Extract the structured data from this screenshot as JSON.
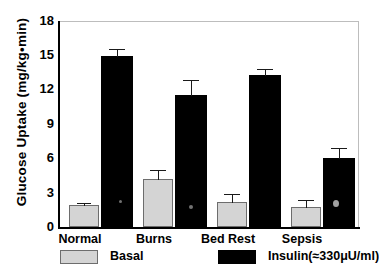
{
  "chart_data": {
    "type": "bar",
    "title": "",
    "xlabel": "",
    "ylabel": "Glucose Uptake (mg/kg•min)",
    "ylim": [
      0,
      18
    ],
    "yticks": [
      18,
      15,
      12,
      9,
      6,
      3,
      0
    ],
    "ytick_labels": [
      "18",
      "15",
      "12",
      "9",
      "6",
      "3",
      "0"
    ],
    "grid": false,
    "legend_position": "bottom",
    "categories": [
      "Normal",
      "Burns",
      "Bed Rest",
      "Sepsis"
    ],
    "series": [
      {
        "name": "Basal",
        "color": "#d4d4d4",
        "values": [
          1.9,
          4.2,
          2.2,
          1.7
        ],
        "errors": [
          0.15,
          0.75,
          0.65,
          0.65
        ]
      },
      {
        "name": "Insulin(≈330μU/ml)",
        "color": "#000000",
        "values": [
          14.85,
          11.5,
          13.2,
          6.0
        ],
        "errors": [
          0.6,
          1.3,
          0.5,
          0.85
        ]
      }
    ]
  },
  "axis": {
    "y_title": "Glucose Uptake (mg/kg•min)",
    "ticks": [
      "18",
      "15",
      "12",
      "9",
      "6",
      "3",
      "0"
    ]
  },
  "categories": [
    {
      "label": "Normal"
    },
    {
      "label": "Burns"
    },
    {
      "label": "Bed Rest"
    },
    {
      "label": "Sepsis"
    }
  ],
  "legend": {
    "basal": {
      "label": "Basal",
      "color": "#d4d4d4"
    },
    "insulin": {
      "label": "Insulin(≈330μU/ml)",
      "color": "#000000"
    }
  }
}
